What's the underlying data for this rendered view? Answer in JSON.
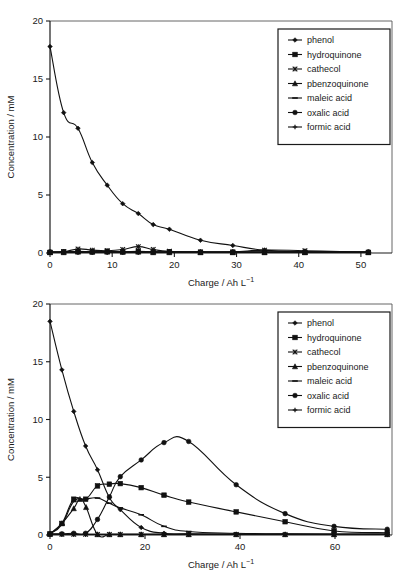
{
  "figure": {
    "background": "#ffffff",
    "ink": "#111111"
  },
  "chart_data": [
    {
      "id": "top",
      "type": "line",
      "title": "",
      "xlabel": "Charge / Ah L",
      "xlabel_sup": "−1",
      "ylabel": "Concentration / mM",
      "xlim": [
        0,
        55
      ],
      "ylim": [
        0,
        20
      ],
      "xticks": [
        0,
        10,
        20,
        30,
        40,
        50
      ],
      "yticks": [
        0,
        5,
        10,
        15,
        20
      ],
      "grid": false,
      "legend_position": "top-right",
      "series": [
        {
          "name": "phenol",
          "marker": "diamond",
          "x": [
            0,
            2.2,
            4.5,
            6.8,
            9.2,
            11.7,
            14.2,
            16.6,
            19.2,
            24.2,
            29.4,
            34.5,
            41.0,
            51.2
          ],
          "y": [
            17.8,
            12.1,
            10.75,
            7.8,
            5.85,
            4.25,
            3.4,
            2.45,
            2.05,
            1.1,
            0.65,
            0.25,
            0.1,
            0.05
          ]
        },
        {
          "name": "hydroquinone",
          "marker": "square",
          "x": [
            0,
            2.2,
            4.5,
            6.8,
            9.2,
            11.7,
            14.2,
            16.6,
            19.2,
            24.2,
            29.4,
            34.5,
            41.0,
            51.2
          ],
          "y": [
            0.05,
            0.1,
            0.15,
            0.1,
            0.15,
            0.1,
            0.15,
            0.1,
            0.1,
            0.05,
            0.05,
            0.05,
            0.05,
            0.05
          ]
        },
        {
          "name": "cathecol",
          "marker": "star",
          "x": [
            0,
            2.2,
            4.5,
            6.8,
            9.2,
            11.7,
            14.2,
            16.6,
            19.2,
            24.2,
            29.4,
            34.5,
            41.0,
            51.2
          ],
          "y": [
            0.05,
            0.1,
            0.35,
            0.25,
            0.2,
            0.3,
            0.55,
            0.3,
            0.15,
            0.1,
            0.1,
            0.25,
            0.2,
            0.05
          ]
        },
        {
          "name": "pbenzoquinone",
          "marker": "triangle",
          "x": [
            0,
            2.2,
            4.5,
            6.8,
            9.2,
            11.7,
            14.2,
            16.6,
            19.2,
            24.2,
            29.4,
            34.5,
            41.0,
            51.2
          ],
          "y": [
            0.05,
            0.05,
            0.1,
            0.1,
            0.1,
            0.1,
            0.1,
            0.05,
            0.05,
            0.05,
            0.05,
            0.05,
            0.05,
            0.05
          ]
        },
        {
          "name": "maleic acid",
          "marker": "dash",
          "x": [
            0,
            2.2,
            4.5,
            6.8,
            9.2,
            11.7,
            14.2,
            16.6,
            19.2,
            24.2,
            29.4,
            34.5,
            41.0,
            51.2
          ],
          "y": [
            0.05,
            0.05,
            0.05,
            0.05,
            0.05,
            0.05,
            0.05,
            0.05,
            0.05,
            0.05,
            0.05,
            0.05,
            0.05,
            0.05
          ]
        },
        {
          "name": "oxalic acid",
          "marker": "circle",
          "x": [
            0,
            2.2,
            4.5,
            6.8,
            9.2,
            11.7,
            14.2,
            16.6,
            19.2,
            24.2,
            29.4,
            34.5,
            41.0,
            51.2
          ],
          "y": [
            0.1,
            0.1,
            0.1,
            0.1,
            0.1,
            0.1,
            0.1,
            0.1,
            0.1,
            0.1,
            0.1,
            0.1,
            0.1,
            0.1
          ]
        },
        {
          "name": "formic acid",
          "marker": "plus",
          "x": [
            0,
            2.2,
            4.5,
            6.8,
            9.2,
            11.7,
            14.2,
            16.6,
            19.2,
            24.2,
            29.4,
            34.5,
            41.0,
            51.2
          ],
          "y": [
            0.05,
            0.05,
            0.05,
            0.05,
            0.05,
            0.05,
            0.05,
            0.05,
            0.05,
            0.05,
            0.05,
            0.05,
            0.05,
            0.05
          ]
        }
      ]
    },
    {
      "id": "bottom",
      "type": "line",
      "title": "",
      "xlabel": "Charge / Ah L",
      "xlabel_sup": "−1",
      "ylabel": "Concentration / mM",
      "xlim": [
        0,
        72
      ],
      "ylim": [
        0,
        20
      ],
      "xticks": [
        0,
        20,
        40,
        60
      ],
      "yticks": [
        0,
        5,
        10,
        15,
        20
      ],
      "grid": false,
      "legend_position": "top-right",
      "series": [
        {
          "name": "phenol",
          "marker": "diamond",
          "x": [
            0,
            2.5,
            5.0,
            7.5,
            10.0,
            12.5,
            14.8,
            19.2,
            24.0,
            29.2,
            39.2,
            49.5,
            59.8,
            71.0
          ],
          "y": [
            18.5,
            14.3,
            10.7,
            7.7,
            5.65,
            3.25,
            2.2,
            0.65,
            0.15,
            0.1,
            0.05,
            0.05,
            0.05,
            0.05
          ]
        },
        {
          "name": "hydroquinone",
          "marker": "square",
          "x": [
            0,
            2.5,
            5.0,
            7.5,
            10.0,
            12.5,
            14.8,
            19.2,
            24.0,
            29.2,
            39.2,
            49.5,
            59.8,
            71.0
          ],
          "y": [
            0.1,
            1.0,
            3.1,
            3.1,
            4.25,
            4.4,
            4.45,
            4.1,
            3.45,
            2.85,
            2.0,
            1.15,
            0.35,
            0.2
          ]
        },
        {
          "name": "cathecol",
          "marker": "star",
          "x": [
            0,
            2.5,
            5.0,
            7.5,
            10.0,
            12.5,
            14.8,
            19.2,
            24.0,
            29.2,
            39.2,
            49.5,
            59.8,
            71.0
          ],
          "y": [
            0.05,
            0.05,
            0.05,
            0.05,
            0.05,
            0.05,
            0.05,
            0.05,
            0.05,
            0.05,
            0.05,
            0.05,
            0.05,
            0.05
          ]
        },
        {
          "name": "pbenzoquinone",
          "marker": "triangle",
          "x": [
            0,
            2.5,
            5.0,
            6.3,
            7.6,
            10.0,
            12.5,
            14.8,
            19.2,
            24.0,
            29.2,
            39.2,
            49.5,
            59.8,
            71.0
          ],
          "y": [
            0.1,
            1.0,
            2.3,
            3.1,
            2.4,
            0.05,
            0.05,
            0.05,
            0.05,
            0.05,
            0.05,
            0.05,
            0.05,
            0.05,
            0.05
          ]
        },
        {
          "name": "maleic acid",
          "marker": "dash",
          "x": [
            0,
            2.5,
            5.0,
            7.5,
            10.0,
            12.5,
            14.8,
            19.2,
            24.0,
            29.2,
            39.2,
            49.5,
            59.8,
            71.0
          ],
          "y": [
            0.1,
            0.9,
            2.9,
            3.1,
            3.2,
            2.75,
            2.35,
            1.75,
            0.75,
            0.3,
            0.15,
            0.1,
            0.05,
            0.05
          ]
        },
        {
          "name": "oxalic acid",
          "marker": "circle",
          "x": [
            0,
            2.5,
            5.0,
            7.5,
            10.0,
            12.5,
            14.8,
            19.2,
            24.0,
            29.2,
            39.2,
            49.5,
            59.8,
            71.0
          ],
          "y": [
            0.1,
            0.1,
            0.15,
            0.15,
            1.35,
            3.3,
            5.05,
            6.5,
            8.0,
            8.1,
            4.35,
            1.85,
            0.75,
            0.5
          ]
        },
        {
          "name": "formic acid",
          "marker": "plus",
          "x": [
            0,
            2.5,
            5.0,
            7.5,
            10.0,
            12.5,
            14.8,
            19.2,
            24.0,
            29.2,
            39.2,
            49.5,
            59.8,
            71.0
          ],
          "y": [
            0.05,
            0.05,
            0.05,
            0.05,
            0.05,
            0.05,
            0.05,
            0.05,
            0.05,
            0.05,
            0.05,
            0.05,
            0.05,
            0.05
          ]
        }
      ]
    }
  ],
  "legend": {
    "items": [
      {
        "label": "phenol",
        "marker": "diamond"
      },
      {
        "label": "hydroquinone",
        "marker": "square"
      },
      {
        "label": "cathecol",
        "marker": "star"
      },
      {
        "label": "pbenzoquinone",
        "marker": "triangle"
      },
      {
        "label": "maleic acid",
        "marker": "dash"
      },
      {
        "label": "oxalic acid",
        "marker": "circle"
      },
      {
        "label": "formic acid",
        "marker": "plus"
      }
    ]
  }
}
